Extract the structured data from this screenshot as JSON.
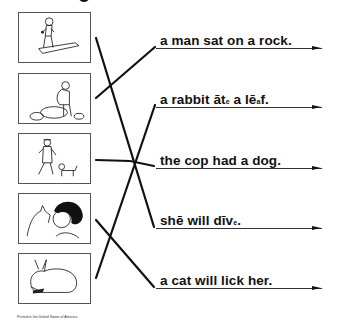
{
  "worksheet": {
    "pictures": [
      {
        "id": "boy-diving-board",
        "description": "boy crouching on a diving board",
        "top": 12
      },
      {
        "id": "man-on-rock",
        "description": "man sitting on a rock",
        "top": 73
      },
      {
        "id": "cop-with-dog",
        "description": "police officer walking with a dog",
        "top": 133
      },
      {
        "id": "girl-with-cat",
        "description": "girl being licked by a cat",
        "top": 193
      },
      {
        "id": "rabbit-eating",
        "description": "rabbit eating a leaf",
        "top": 253
      }
    ],
    "sentences": [
      {
        "parts": [
          "a man sat on a rock."
        ],
        "underline_y": 48,
        "text_top": 34
      },
      {
        "parts": [
          "a rabbit ",
          "āt",
          "e",
          " a lē",
          "a",
          "f."
        ],
        "underline_y": 107,
        "text_top": 93
      },
      {
        "parts": [
          "the cop had a dog."
        ],
        "underline_y": 168,
        "text_top": 154
      },
      {
        "parts": [
          "shē will dīv",
          "e",
          "."
        ],
        "underline_y": 228,
        "text_top": 214
      },
      {
        "parts": [
          "a cat will lick her."
        ],
        "underline_y": 288,
        "text_top": 274
      }
    ],
    "matching_lines": [
      {
        "from_picture": 1,
        "to_sentence": 4,
        "x1": 96,
        "y1": 38,
        "x2": 154,
        "y2": 227
      },
      {
        "from_picture": 2,
        "to_sentence": 1,
        "x1": 96,
        "y1": 98,
        "x2": 155,
        "y2": 47
      },
      {
        "from_picture": 3,
        "to_sentence": 3,
        "x1": 96,
        "y1": 160,
        "x2": 154,
        "y2": 166
      },
      {
        "from_picture": 4,
        "to_sentence": 5,
        "x1": 96,
        "y1": 220,
        "x2": 154,
        "y2": 287
      },
      {
        "from_picture": 5,
        "to_sentence": 2,
        "x1": 96,
        "y1": 278,
        "x2": 155,
        "y2": 105
      }
    ],
    "footer": "Printed in the United States of America"
  }
}
